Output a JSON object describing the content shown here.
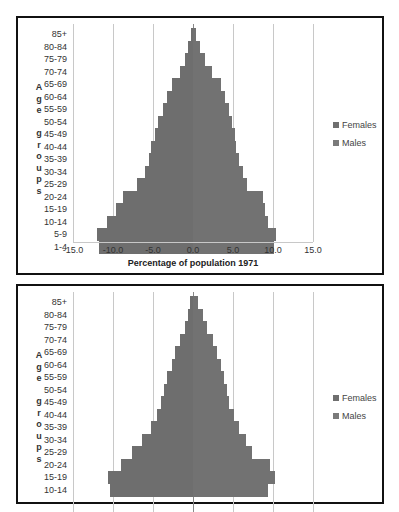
{
  "chart_data": [
    {
      "type": "bar",
      "orientation": "horizontal",
      "subtype": "population-pyramid",
      "title": "",
      "xlabel": "Percentage of population 1971",
      "ylabel": "Age groups",
      "xlim": [
        -15,
        15
      ],
      "xticks": [
        "-15.0",
        "-10.0",
        "-5.0",
        "0.0",
        "5.0",
        "10.0",
        "15.0"
      ],
      "grid": true,
      "legend_position": "right",
      "categories": [
        "85+",
        "80-84",
        "75-79",
        "70-74",
        "65-69",
        "60-64",
        "55-59",
        "50-54",
        "45-49",
        "40-44",
        "35-39",
        "30-34",
        "25-29",
        "20-24",
        "15-19",
        "10-14",
        "5-9",
        "1-4"
      ],
      "series": [
        {
          "name": "Females",
          "values": [
            0.4,
            0.9,
            1.5,
            2.4,
            3.5,
            4.0,
            4.5,
            4.9,
            5.2,
            5.4,
            5.7,
            6.2,
            6.7,
            8.7,
            9.0,
            9.4,
            10.4,
            10.1
          ]
        },
        {
          "name": "Males",
          "values": [
            -0.3,
            -0.6,
            -1.0,
            -1.6,
            -2.6,
            -3.3,
            -3.8,
            -4.4,
            -4.8,
            -5.2,
            -5.5,
            -6.0,
            -7.0,
            -8.8,
            -9.6,
            -10.8,
            -12.0,
            -11.8
          ]
        }
      ]
    },
    {
      "type": "bar",
      "orientation": "horizontal",
      "subtype": "population-pyramid",
      "title": "",
      "xlabel": "",
      "ylabel": "Age groups",
      "xlim": [
        -15,
        15
      ],
      "grid": true,
      "legend_position": "right",
      "categories": [
        "85+",
        "80-84",
        "75-79",
        "70-74",
        "65-69",
        "60-64",
        "55-59",
        "50-54",
        "45-49",
        "40-44",
        "35-39",
        "30-34",
        "25-29",
        "20-24",
        "15-19",
        "10-14"
      ],
      "series": [
        {
          "name": "Females",
          "values": [
            0.6,
            1.2,
            1.8,
            2.5,
            3.0,
            3.5,
            3.9,
            4.2,
            4.5,
            5.1,
            5.8,
            6.6,
            7.4,
            9.6,
            10.2,
            9.4
          ]
        },
        {
          "name": "Males",
          "values": [
            -0.4,
            -0.6,
            -1.0,
            -1.6,
            -2.2,
            -2.6,
            -3.2,
            -3.6,
            -4.0,
            -4.5,
            -5.3,
            -6.4,
            -7.6,
            -9.0,
            -10.6,
            -10.4
          ]
        }
      ]
    }
  ],
  "charts": [
    {
      "ylabel_letters": [
        "A",
        "g",
        "e",
        "",
        "g",
        "r",
        "o",
        "u",
        "p",
        "s"
      ],
      "xlabel": "Percentage of population 1971",
      "legend": [
        {
          "label": "Females",
          "color": "#6f6f6f"
        },
        {
          "label": "Males",
          "color": "#7a7a7a"
        }
      ]
    },
    {
      "ylabel_letters": [
        "A",
        "g",
        "e",
        "",
        "g",
        "r",
        "o",
        "u",
        "p",
        "s"
      ],
      "legend": [
        {
          "label": "Females",
          "color": "#6f6f6f"
        },
        {
          "label": "Males",
          "color": "#7a7a7a"
        }
      ]
    }
  ]
}
